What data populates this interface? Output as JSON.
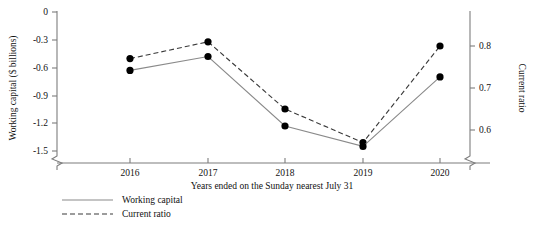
{
  "chart_data": {
    "type": "line",
    "title": "",
    "xlabel": "Years ended on the Sunday nearest July 31",
    "categories": [
      "2016",
      "2017",
      "2018",
      "2019",
      "2020"
    ],
    "grid": false,
    "legend_position": "bottom-left",
    "axes": {
      "left": {
        "label": "Working capital ($ billions)",
        "ticks": [
          "0",
          "-0.3",
          "-0.6",
          "-0.9",
          "-1.2",
          "-1.5"
        ],
        "tick_values": [
          0,
          -0.3,
          -0.6,
          -0.9,
          -1.2,
          -1.5
        ],
        "ylim": [
          -1.5,
          0
        ],
        "axis_break": true
      },
      "right": {
        "label": "Current ratio",
        "ticks": [
          "0.8",
          "0.7",
          "0.6"
        ],
        "tick_values": [
          0.8,
          0.7,
          0.6
        ],
        "ylim": [
          0.55,
          0.85
        ],
        "axis_break": true
      },
      "x": {
        "ticks": [
          "2016",
          "2017",
          "2018",
          "2019",
          "2020"
        ]
      }
    },
    "series": [
      {
        "name": "Working capital",
        "style": "solid",
        "axis": "left",
        "values": [
          -0.63,
          -0.48,
          -1.23,
          -1.45,
          -0.7
        ]
      },
      {
        "name": "Current ratio",
        "style": "dashed",
        "axis": "right",
        "values": [
          0.77,
          0.81,
          0.65,
          0.57,
          0.8
        ]
      }
    ],
    "legend": [
      {
        "label": "Working capital",
        "style": "solid"
      },
      {
        "label": "Current ratio",
        "style": "dashed"
      }
    ]
  }
}
